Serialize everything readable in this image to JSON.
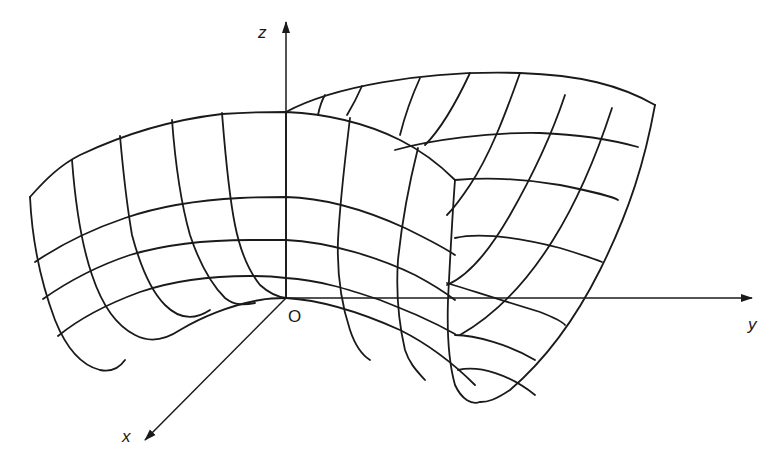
{
  "figure": {
    "background": "#ffffff",
    "ink": "#1a1a1a"
  },
  "axes": {
    "origin_label": "O",
    "x_label": "x",
    "y_label": "y",
    "z_label": "z",
    "origin": [
      286,
      298
    ],
    "z_end": [
      286,
      22
    ],
    "y_end": [
      752,
      298
    ],
    "x_end": [
      145,
      440
    ]
  },
  "surface": {
    "back_sheet_paths": [
      "M286,112 C330,88 420,70 520,73 C580,75 620,85 655,105",
      "M395,150 C430,140 490,132 540,133 C590,135 620,142 638,147",
      "M455,180 C480,178 520,178 560,185 C595,192 615,198 618,200",
      "M455,238 C480,232 520,238 560,248 C583,255 597,260 602,262",
      "M447,283 C470,290 500,300 540,312 C555,318 563,322 565,325",
      "M455,335 C475,335 510,345 535,360",
      "M458,370 C480,365 510,375 535,395",
      "M655,105 C645,160 630,210 600,270 C575,320 545,360 510,390 C495,400 488,402 480,402",
      "M612,108 C595,160 575,205 553,240 C525,285 495,315 460,335",
      "M565,95 C550,140 530,180 510,215 C490,250 470,275 447,285",
      "M520,73 C505,115 490,155 470,185 C460,200 452,210 447,215",
      "M470,73 C455,105 440,130 425,145",
      "M420,78 C410,100 405,115 400,135",
      "M362,86 C355,102 350,110 347,115",
      "M325,95 C322,100 320,105 318,115"
    ],
    "front_sheet_paths": [
      "M30,197 C45,180 60,165 80,155 C120,136 170,120 222,114 C250,112 275,112 286,112 C330,114 370,125 400,140 C420,150 440,165 455,180",
      "M35,262 C60,245 90,230 125,218 C160,206 200,200 240,198 C260,197 275,197 286,197 C330,198 370,212 405,228 C425,238 440,245 455,255",
      "M43,299 C70,280 100,265 130,255 C170,243 210,240 250,240 C265,240 278,240 286,240 C330,242 380,258 415,275 C430,283 442,290 455,300",
      "M58,336 C80,318 110,303 140,292 C175,280 215,276 250,276 C265,276 278,277 286,278 C320,280 350,290 380,300 C410,312 430,320 455,334",
      "M30,197 C32,240 40,280 55,320 C65,345 80,365 100,370 C110,372 118,370 125,360",
      "M72,160 C75,200 80,240 92,275 C102,305 115,325 135,335 C150,343 165,340 180,330 C200,318 230,305 260,300 C270,298 278,298 286,298",
      "M120,136 C123,170 126,200 132,235 C140,265 150,290 165,305 C180,320 195,320 210,310",
      "M172,120 C175,160 180,200 190,235 C200,265 212,285 225,298 C235,306 245,305 255,303",
      "M222,113 C225,150 228,190 235,225 C240,250 248,270 260,285 C270,294 278,297 286,298",
      "M286,112 L286,298",
      "M350,118 C345,160 340,200 338,240 C337,270 340,300 350,330 C355,345 362,355 370,360",
      "M418,148 C410,180 402,220 398,260 C396,290 398,320 405,350 C410,365 418,372 425,380",
      "M455,180 C452,220 450,260 448,300 C447,330 448,360 455,385 C462,400 472,405 480,402",
      "M286,298 C320,300 360,312 400,330 C430,345 455,365 475,385"
    ]
  }
}
